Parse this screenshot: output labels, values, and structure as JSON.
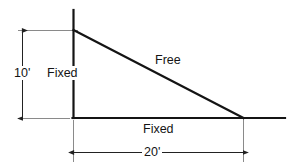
{
  "figure": {
    "kind": "engineering-line-diagram",
    "stroke_color": "#141414",
    "thin_stroke_color": "#6b6b6b",
    "background_color": "#ffffff",
    "labels": {
      "height_dimension": "10'",
      "width_dimension": "20'",
      "left_edge": "Fixed",
      "bottom_edge": "Fixed",
      "hypotenuse_edge": "Free"
    },
    "geometry": {
      "apex_top": [
        73,
        30
      ],
      "corner_origin": [
        73,
        118
      ],
      "corner_right": [
        243,
        118
      ],
      "height_feet": 10,
      "width_feet": 20
    },
    "boundary_conditions": [
      {
        "edge": "left",
        "label": "Fixed"
      },
      {
        "edge": "bottom",
        "label": "Fixed"
      },
      {
        "edge": "hypotenuse",
        "label": "Free"
      }
    ]
  }
}
